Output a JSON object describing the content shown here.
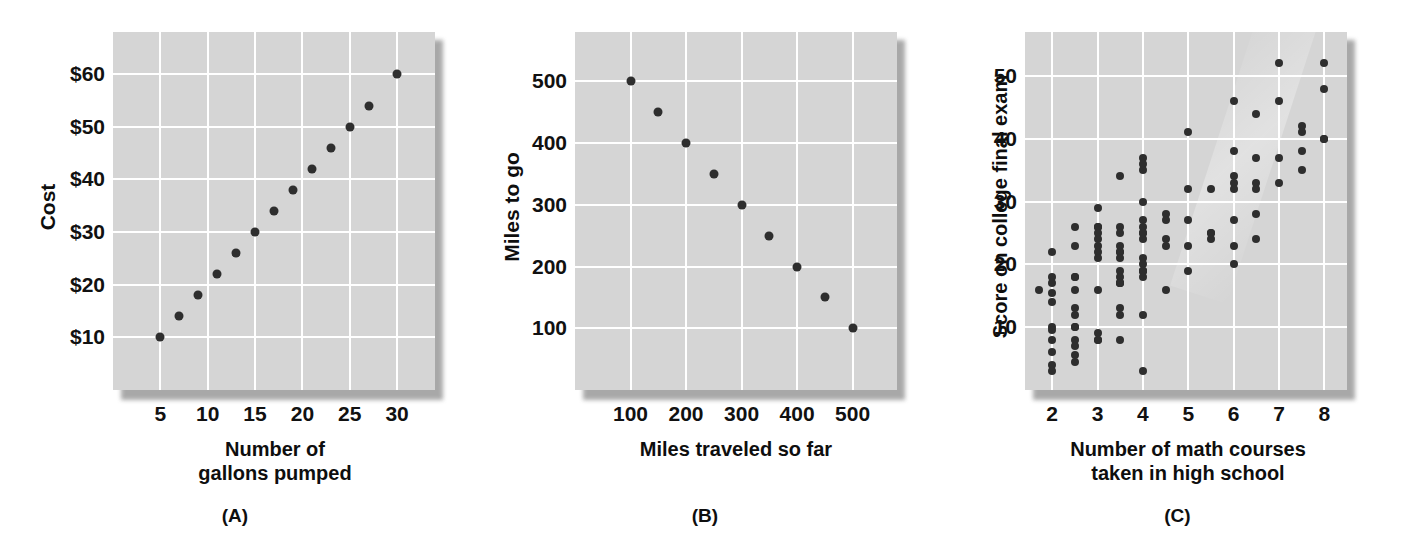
{
  "figure": {
    "background_color": "#ffffff",
    "plot_background_color": "#d5d5d5",
    "gridline_color": "#ffffff",
    "dot_color": "#2e2e2e"
  },
  "panels": [
    {
      "id": "A",
      "caption": "(A)",
      "xlabel_line1": "Number of",
      "xlabel_line2": "gallons pumped",
      "ylabel": "Cost",
      "xticks": [
        "5",
        "10",
        "15",
        "20",
        "25",
        "30"
      ],
      "yticks": [
        "$60",
        "$50",
        "$40",
        "$30",
        "$20",
        "$10"
      ]
    },
    {
      "id": "B",
      "caption": "(B)",
      "xlabel_line1": "Miles traveled so far",
      "xlabel_line2": "",
      "ylabel": "Miles to go",
      "xticks": [
        "100",
        "200",
        "300",
        "400",
        "500"
      ],
      "yticks": [
        "500",
        "400",
        "300",
        "200",
        "100"
      ]
    },
    {
      "id": "C",
      "caption": "(C)",
      "xlabel_line1": "Number of math courses",
      "xlabel_line2": "taken in high school",
      "ylabel": "Score on college final exam",
      "xticks": [
        "2",
        "3",
        "4",
        "5",
        "6",
        "7",
        "8"
      ],
      "yticks": [
        "50",
        "40",
        "30",
        "20",
        "10"
      ]
    }
  ],
  "chart_data": [
    {
      "type": "scatter",
      "panel": "A",
      "title": "",
      "xlabel": "Number of gallons pumped",
      "ylabel": "Cost",
      "xlim": [
        0,
        34
      ],
      "ylim": [
        0,
        68
      ],
      "xticks": [
        5,
        10,
        15,
        20,
        25,
        30
      ],
      "yticks": [
        10,
        20,
        30,
        40,
        50,
        60
      ],
      "ytick_labels": [
        "$10",
        "$20",
        "$30",
        "$40",
        "$50",
        "$60"
      ],
      "grid": true,
      "relationship": "perfect positive linear",
      "points": [
        [
          5,
          10
        ],
        [
          7,
          14
        ],
        [
          9,
          18
        ],
        [
          11,
          22
        ],
        [
          13,
          26
        ],
        [
          15,
          30
        ],
        [
          17,
          34
        ],
        [
          19,
          38
        ],
        [
          21,
          42
        ],
        [
          23,
          46
        ],
        [
          25,
          50
        ],
        [
          27,
          54
        ],
        [
          30,
          60
        ]
      ]
    },
    {
      "type": "scatter",
      "panel": "B",
      "title": "",
      "xlabel": "Miles traveled so far",
      "ylabel": "Miles to go",
      "xlim": [
        0,
        580
      ],
      "ylim": [
        0,
        580
      ],
      "xticks": [
        100,
        200,
        300,
        400,
        500
      ],
      "yticks": [
        100,
        200,
        300,
        400,
        500
      ],
      "grid": true,
      "relationship": "perfect negative linear",
      "points": [
        [
          100,
          500
        ],
        [
          150,
          450
        ],
        [
          200,
          400
        ],
        [
          250,
          350
        ],
        [
          300,
          300
        ],
        [
          350,
          250
        ],
        [
          400,
          200
        ],
        [
          450,
          150
        ],
        [
          500,
          100
        ]
      ]
    },
    {
      "type": "scatter",
      "panel": "C",
      "title": "",
      "xlabel": "Number of math courses taken in high school",
      "ylabel": "Score on college final exam",
      "xlim": [
        1.4,
        8.5
      ],
      "ylim": [
        0,
        57
      ],
      "xticks": [
        2,
        3,
        4,
        5,
        6,
        7,
        8
      ],
      "yticks": [
        10,
        20,
        30,
        40,
        50
      ],
      "grid": true,
      "relationship": "moderate positive, scattered",
      "points": [
        [
          1.7,
          16
        ],
        [
          2.0,
          22
        ],
        [
          2.0,
          18
        ],
        [
          2.0,
          17
        ],
        [
          2.0,
          15.5
        ],
        [
          2.0,
          14
        ],
        [
          2.0,
          10
        ],
        [
          2.0,
          9.5
        ],
        [
          2.0,
          8
        ],
        [
          2.0,
          6
        ],
        [
          2.0,
          4
        ],
        [
          2.0,
          3
        ],
        [
          2.5,
          26
        ],
        [
          2.5,
          23
        ],
        [
          2.5,
          18
        ],
        [
          2.5,
          18
        ],
        [
          2.5,
          16
        ],
        [
          2.5,
          13
        ],
        [
          2.5,
          12
        ],
        [
          2.5,
          10
        ],
        [
          2.5,
          10
        ],
        [
          2.5,
          8
        ],
        [
          2.5,
          7
        ],
        [
          2.5,
          5.5
        ],
        [
          2.5,
          4.5
        ],
        [
          3.0,
          29
        ],
        [
          3.0,
          26
        ],
        [
          3.0,
          26
        ],
        [
          3.0,
          25
        ],
        [
          3.0,
          24
        ],
        [
          3.0,
          23
        ],
        [
          3.0,
          22
        ],
        [
          3.0,
          21
        ],
        [
          3.0,
          16
        ],
        [
          3.0,
          9
        ],
        [
          3.0,
          8
        ],
        [
          3.0,
          8
        ],
        [
          3.5,
          34
        ],
        [
          3.5,
          26
        ],
        [
          3.5,
          25
        ],
        [
          3.5,
          23
        ],
        [
          3.5,
          22
        ],
        [
          3.5,
          22
        ],
        [
          3.5,
          21
        ],
        [
          3.5,
          19
        ],
        [
          3.5,
          18
        ],
        [
          3.5,
          17
        ],
        [
          3.5,
          17
        ],
        [
          3.5,
          17
        ],
        [
          3.5,
          13
        ],
        [
          3.5,
          12
        ],
        [
          3.5,
          8
        ],
        [
          4.0,
          37
        ],
        [
          4.0,
          36
        ],
        [
          4.0,
          35
        ],
        [
          4.0,
          30
        ],
        [
          4.0,
          27
        ],
        [
          4.0,
          26
        ],
        [
          4.0,
          25
        ],
        [
          4.0,
          25
        ],
        [
          4.0,
          24
        ],
        [
          4.0,
          21
        ],
        [
          4.0,
          20
        ],
        [
          4.0,
          19
        ],
        [
          4.0,
          19
        ],
        [
          4.0,
          19
        ],
        [
          4.0,
          18
        ],
        [
          4.0,
          12
        ],
        [
          4.0,
          3
        ],
        [
          4.5,
          28
        ],
        [
          4.5,
          27
        ],
        [
          4.5,
          24
        ],
        [
          4.5,
          23
        ],
        [
          4.5,
          16
        ],
        [
          5.0,
          41
        ],
        [
          5.0,
          32
        ],
        [
          5.0,
          27
        ],
        [
          5.0,
          23
        ],
        [
          5.0,
          19
        ],
        [
          5.5,
          32
        ],
        [
          5.5,
          25
        ],
        [
          5.5,
          25
        ],
        [
          5.5,
          24
        ],
        [
          6.0,
          46
        ],
        [
          6.0,
          38
        ],
        [
          6.0,
          34
        ],
        [
          6.0,
          33
        ],
        [
          6.0,
          32
        ],
        [
          6.0,
          27
        ],
        [
          6.0,
          23
        ],
        [
          6.0,
          20
        ],
        [
          6.5,
          44
        ],
        [
          6.5,
          37
        ],
        [
          6.5,
          33
        ],
        [
          6.5,
          32
        ],
        [
          6.5,
          28
        ],
        [
          6.5,
          24
        ],
        [
          7.0,
          52
        ],
        [
          7.0,
          46
        ],
        [
          7.0,
          37
        ],
        [
          7.0,
          33
        ],
        [
          7.5,
          42
        ],
        [
          7.5,
          41
        ],
        [
          7.5,
          38
        ],
        [
          7.5,
          35
        ],
        [
          8.0,
          52
        ],
        [
          8.0,
          48
        ],
        [
          8.0,
          40
        ],
        [
          8.0,
          40
        ]
      ]
    }
  ]
}
